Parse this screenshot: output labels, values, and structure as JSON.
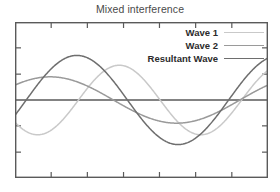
{
  "chart_data": {
    "type": "line",
    "title": "Mixed interference",
    "subtitle": "",
    "xlabel": "",
    "ylabel": "",
    "xlim": [
      0,
      10
    ],
    "ylim": [
      -1.75,
      1.75
    ],
    "grid": false,
    "x_tick_labels": [],
    "y_tick_labels": [],
    "x_ticks": [
      1.43,
      2.86,
      4.29,
      5.71,
      7.14,
      8.57
    ],
    "y_ticks": [
      -1.17,
      -0.58,
      0.58,
      1.17
    ],
    "zero_line": true,
    "legend_position": "top-right",
    "legend": [
      "Wave 1",
      "Wave 2",
      "Resultant Wave"
    ],
    "series": [
      {
        "name": "Wave 1",
        "color": "#c9c9c9",
        "amplitude": 0.78,
        "cycles": 1.55,
        "phase_deg": -140,
        "x": [
          0,
          0.5,
          1,
          1.5,
          2,
          2.5,
          3,
          3.5,
          4,
          4.5,
          5,
          5.5,
          6,
          6.5,
          7,
          7.5,
          8,
          8.5,
          9,
          9.5,
          10
        ],
        "values": [
          -0.6,
          -0.26,
          0.13,
          0.47,
          0.7,
          0.78,
          0.69,
          0.46,
          0.12,
          -0.26,
          -0.59,
          -0.77,
          -0.78,
          -0.62,
          -0.31,
          0.08,
          0.44,
          0.69,
          0.78,
          0.68,
          0.42
        ]
      },
      {
        "name": "Wave 2",
        "color": "#9a9a9a",
        "amplitude": 0.52,
        "cycles": 1.0,
        "phase_deg": 40,
        "x": [
          0,
          0.5,
          1,
          1.5,
          2,
          2.5,
          3,
          3.5,
          4,
          4.5,
          5,
          5.5,
          6,
          6.5,
          7,
          7.5,
          8,
          8.5,
          9,
          9.5,
          10
        ],
        "values": [
          0.33,
          0.47,
          0.52,
          0.49,
          0.37,
          0.19,
          -0.02,
          -0.23,
          -0.4,
          -0.5,
          -0.52,
          -0.45,
          -0.31,
          -0.12,
          0.09,
          0.29,
          0.44,
          0.51,
          0.51,
          0.42,
          0.27
        ]
      },
      {
        "name": "Resultant Wave",
        "color": "#6e6e6e",
        "amplitude": 1.0,
        "cycles": 1.25,
        "phase_deg": -20,
        "x": [
          0,
          0.5,
          1,
          1.5,
          2,
          2.5,
          3,
          3.5,
          4,
          4.5,
          5,
          5.5,
          6,
          6.5,
          7,
          7.5,
          8,
          8.5,
          9,
          9.5,
          10
        ],
        "values": [
          0.28,
          0.66,
          0.91,
          1.0,
          0.9,
          0.64,
          0.27,
          -0.15,
          -0.54,
          -0.83,
          -0.99,
          -0.96,
          -0.76,
          -0.42,
          0.0,
          0.42,
          0.76,
          0.96,
          0.99,
          0.83,
          0.54
        ]
      }
    ],
    "zero_line_color": "#5a5a5a",
    "frame_color": "#5a5a5a",
    "background": "#ffffff"
  },
  "legend_items": [
    {
      "label": "Wave 1",
      "color": "#c9c9c9"
    },
    {
      "label": "Wave 2",
      "color": "#9a9a9a"
    },
    {
      "label": "Resultant Wave",
      "color": "#6e6e6e"
    }
  ]
}
